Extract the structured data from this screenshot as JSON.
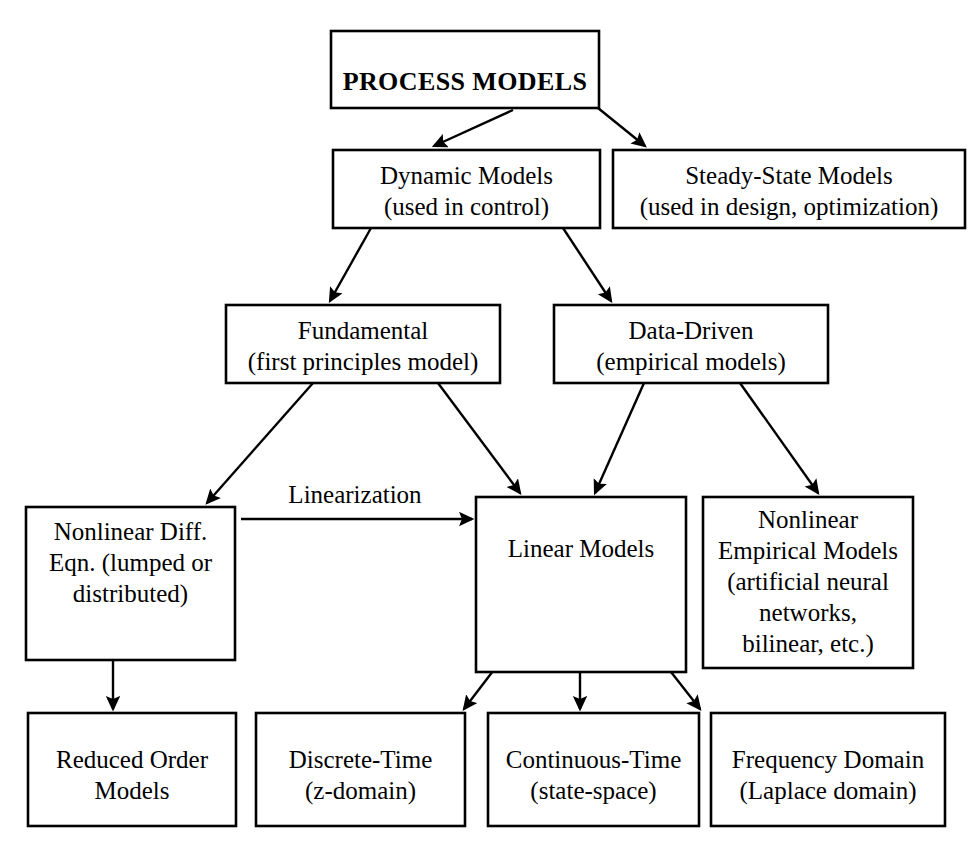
{
  "diagram": {
    "style": {
      "background": "#ffffff",
      "box_fill": "#ffffff",
      "stroke": "#000000",
      "text_color": "#000000"
    },
    "nodes": [
      {
        "id": "process-models",
        "lines": [
          "PROCESS MODELS"
        ],
        "bold": true,
        "x": 331,
        "y": 31,
        "w": 268,
        "h": 77,
        "text_anchor_y": 84
      },
      {
        "id": "dynamic-models",
        "lines": [
          "Dynamic Models",
          "(used in control)"
        ],
        "bold": false,
        "x": 333,
        "y": 150,
        "w": 267,
        "h": 78,
        "text_anchor_y": 178
      },
      {
        "id": "steady-state-models",
        "lines": [
          "Steady-State Models",
          "(used in design, optimization)"
        ],
        "bold": false,
        "x": 613,
        "y": 150,
        "w": 352,
        "h": 78,
        "text_anchor_y": 178
      },
      {
        "id": "fundamental",
        "lines": [
          "Fundamental",
          "(first principles model)"
        ],
        "bold": false,
        "x": 226,
        "y": 305,
        "w": 274,
        "h": 78,
        "text_anchor_y": 333
      },
      {
        "id": "data-driven",
        "lines": [
          "Data-Driven",
          "(empirical models)"
        ],
        "bold": false,
        "x": 554,
        "y": 305,
        "w": 274,
        "h": 78,
        "text_anchor_y": 333
      },
      {
        "id": "nonlinear-diff-eqn",
        "lines": [
          "Nonlinear Diff.",
          "Eqn. (lumped or",
          "distributed)"
        ],
        "bold": false,
        "x": 26,
        "y": 507,
        "w": 209,
        "h": 153,
        "text_anchor_y": 534
      },
      {
        "id": "linear-models",
        "lines": [
          "Linear Models"
        ],
        "bold": false,
        "x": 476,
        "y": 497,
        "w": 210,
        "h": 175,
        "text_anchor_y": 551
      },
      {
        "id": "nonlinear-empirical-models",
        "lines": [
          "Nonlinear",
          "Empirical Models",
          "(artificial neural",
          "networks,",
          "bilinear, etc.)"
        ],
        "bold": false,
        "x": 703,
        "y": 497,
        "w": 210,
        "h": 171,
        "text_anchor_y": 522
      },
      {
        "id": "reduced-order-models",
        "lines": [
          "Reduced Order",
          "Models"
        ],
        "bold": false,
        "x": 28,
        "y": 713,
        "w": 208,
        "h": 113,
        "text_anchor_y": 762
      },
      {
        "id": "discrete-time",
        "lines": [
          "Discrete-Time",
          "(z-domain)"
        ],
        "bold": false,
        "x": 256,
        "y": 713,
        "w": 209,
        "h": 113,
        "text_anchor_y": 762
      },
      {
        "id": "continuous-time",
        "lines": [
          "Continuous-Time",
          "(state-space)"
        ],
        "bold": false,
        "x": 488,
        "y": 713,
        "w": 211,
        "h": 113,
        "text_anchor_y": 762
      },
      {
        "id": "frequency-domain",
        "lines": [
          "Frequency Domain",
          "(Laplace domain)"
        ],
        "bold": false,
        "x": 711,
        "y": 713,
        "w": 234,
        "h": 113,
        "text_anchor_y": 762
      }
    ],
    "edges": [
      {
        "id": "process-to-dynamic",
        "from": "process-models",
        "to": "dynamic-models",
        "x1": 513,
        "y1": 110,
        "x2": 434,
        "y2": 146,
        "arrow": true
      },
      {
        "id": "process-to-steady-state",
        "from": "process-models",
        "to": "steady-state-models",
        "x1": 598,
        "y1": 108,
        "x2": 645,
        "y2": 146,
        "arrow": true
      },
      {
        "id": "dynamic-to-fundamental",
        "from": "dynamic-models",
        "to": "fundamental",
        "x1": 371,
        "y1": 228,
        "x2": 330,
        "y2": 301,
        "arrow": true
      },
      {
        "id": "dynamic-to-data-driven",
        "from": "dynamic-models",
        "to": "data-driven",
        "x1": 563,
        "y1": 228,
        "x2": 611,
        "y2": 301,
        "arrow": true
      },
      {
        "id": "fundamental-to-nonlinear-diff",
        "from": "fundamental",
        "to": "nonlinear-diff-eqn",
        "x1": 313,
        "y1": 383,
        "x2": 207,
        "y2": 503,
        "arrow": true
      },
      {
        "id": "fundamental-to-linear",
        "from": "fundamental",
        "to": "linear-models",
        "x1": 438,
        "y1": 383,
        "x2": 520,
        "y2": 493,
        "arrow": true
      },
      {
        "id": "data-driven-to-linear",
        "from": "data-driven",
        "to": "linear-models",
        "x1": 644,
        "y1": 383,
        "x2": 595,
        "y2": 493,
        "arrow": true
      },
      {
        "id": "data-driven-to-nonlinear-empirical",
        "from": "data-driven",
        "to": "nonlinear-empirical-models",
        "x1": 740,
        "y1": 383,
        "x2": 818,
        "y2": 493,
        "arrow": true
      },
      {
        "id": "linearization-edge",
        "from": "nonlinear-diff-eqn",
        "to": "linear-models",
        "x1": 241,
        "y1": 519,
        "x2": 472,
        "y2": 519,
        "arrow": true,
        "label": "Linearization",
        "label_x": 355,
        "label_y": 503
      },
      {
        "id": "nonlinear-diff-to-reduced-order",
        "from": "nonlinear-diff-eqn",
        "to": "reduced-order-models",
        "x1": 113,
        "y1": 622,
        "x2": 113,
        "y2": 709,
        "arrow": true
      },
      {
        "id": "linear-to-discrete-time",
        "from": "linear-models",
        "to": "discrete-time",
        "x1": 573,
        "y1": 566,
        "x2": 464,
        "y2": 709,
        "arrow": true
      },
      {
        "id": "linear-to-continuous-time",
        "from": "linear-models",
        "to": "continuous-time",
        "x1": 580,
        "y1": 566,
        "x2": 580,
        "y2": 709,
        "arrow": true
      },
      {
        "id": "linear-to-frequency-domain",
        "from": "linear-models",
        "to": "frequency-domain",
        "x1": 588,
        "y1": 566,
        "x2": 700,
        "y2": 709,
        "arrow": true
      }
    ]
  }
}
